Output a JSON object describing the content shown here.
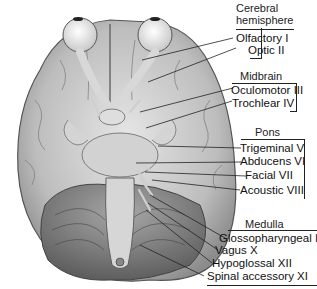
{
  "diagram": {
    "groups": [
      {
        "header": "Cerebral\nhemisphere",
        "header_line1": "Cerebral",
        "header_line2": "hemisphere",
        "labels": [
          "Olfactory I",
          "Optic II"
        ]
      },
      {
        "header": "Midbrain",
        "labels": [
          "Oculomotor III",
          "Trochlear IV"
        ]
      },
      {
        "header": "Pons",
        "labels": [
          "Trigeminal V",
          "Abducens VI",
          "Facial VII",
          "Acoustic VIII"
        ]
      },
      {
        "header": "Medulla",
        "labels": [
          "Glossopharyngeal IX",
          "Vagus X",
          "Hypoglossal XII",
          "Spinal accessory XI"
        ]
      }
    ]
  }
}
